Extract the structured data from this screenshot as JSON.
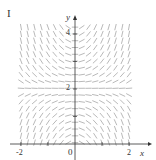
{
  "figure": {
    "panel_label": "I",
    "type": "slope field",
    "x_axis": {
      "label": "x",
      "ticks": [
        "-2",
        "2"
      ],
      "range": [
        -2,
        2
      ]
    },
    "y_axis": {
      "label": "y",
      "ticks": [
        "2",
        "4"
      ],
      "range": [
        0,
        4
      ]
    },
    "origin_label": "0",
    "equilibrium_y": 2,
    "colors": {
      "field": "#8a8a8a",
      "axes": "#333333",
      "background": "#ffffff"
    }
  }
}
